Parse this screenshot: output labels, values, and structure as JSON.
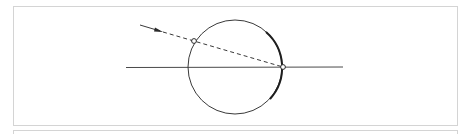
{
  "diagram": {
    "title": "",
    "elements": [
      {
        "id": "circle",
        "type": "circle"
      },
      {
        "id": "horizontal-line",
        "type": "line"
      },
      {
        "id": "incoming-ray",
        "type": "dashed-line",
        "arrow": true
      },
      {
        "id": "entry-point",
        "type": "open-point"
      },
      {
        "id": "exit-point",
        "type": "open-point"
      },
      {
        "id": "highlighted-arc",
        "type": "thick-arc"
      }
    ],
    "colors": {
      "stroke": "#3a3a3a",
      "frame": "#d4d4d4",
      "background": "#ffffff"
    }
  }
}
